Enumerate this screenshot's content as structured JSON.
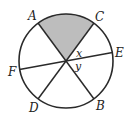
{
  "diagram": {
    "type": "circle-with-diameters",
    "colors": {
      "stroke": "#2a2a2a",
      "shade": "#bdbdbd",
      "background": "#ffffff"
    },
    "points": {
      "A": "A",
      "B": "B",
      "C": "C",
      "D": "D",
      "E": "E",
      "F": "F"
    },
    "angles": {
      "x": "x",
      "y": "y"
    },
    "lines": [
      "AB",
      "CD",
      "EF"
    ],
    "shaded_region": "sector AC"
  }
}
